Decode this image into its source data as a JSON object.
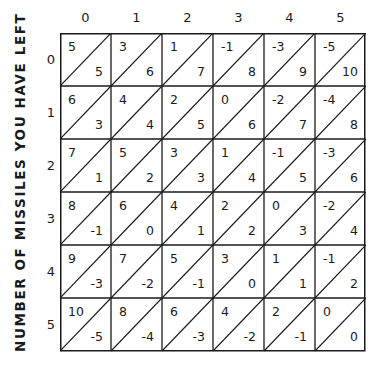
{
  "axis": {
    "vertical_title": "NUMBER OF MISSILES YOU HAVE LEFT",
    "columns": [
      "0",
      "1",
      "2",
      "3",
      "4",
      "5"
    ],
    "rows": [
      "0",
      "1",
      "2",
      "3",
      "4",
      "5"
    ]
  },
  "grid": {
    "rows": [
      [
        {
          "upper": "5",
          "lower": "5"
        },
        {
          "upper": "3",
          "lower": "6"
        },
        {
          "upper": "1",
          "lower": "7"
        },
        {
          "upper": "-1",
          "lower": "8"
        },
        {
          "upper": "-3",
          "lower": "9"
        },
        {
          "upper": "-5",
          "lower": "10"
        }
      ],
      [
        {
          "upper": "6",
          "lower": "3"
        },
        {
          "upper": "4",
          "lower": "4"
        },
        {
          "upper": "2",
          "lower": "5"
        },
        {
          "upper": "0",
          "lower": "6"
        },
        {
          "upper": "-2",
          "lower": "7"
        },
        {
          "upper": "-4",
          "lower": "8"
        }
      ],
      [
        {
          "upper": "7",
          "lower": "1"
        },
        {
          "upper": "5",
          "lower": "2"
        },
        {
          "upper": "3",
          "lower": "3"
        },
        {
          "upper": "1",
          "lower": "4"
        },
        {
          "upper": "-1",
          "lower": "5"
        },
        {
          "upper": "-3",
          "lower": "6"
        }
      ],
      [
        {
          "upper": "8",
          "lower": "-1"
        },
        {
          "upper": "6",
          "lower": "0"
        },
        {
          "upper": "4",
          "lower": "1"
        },
        {
          "upper": "2",
          "lower": "2"
        },
        {
          "upper": "0",
          "lower": "3"
        },
        {
          "upper": "-2",
          "lower": "4"
        }
      ],
      [
        {
          "upper": "9",
          "lower": "-3"
        },
        {
          "upper": "7",
          "lower": "-2"
        },
        {
          "upper": "5",
          "lower": "-1"
        },
        {
          "upper": "3",
          "lower": "0"
        },
        {
          "upper": "1",
          "lower": "1"
        },
        {
          "upper": "-1",
          "lower": "2"
        }
      ],
      [
        {
          "upper": "10",
          "lower": "-5"
        },
        {
          "upper": "8",
          "lower": "-4"
        },
        {
          "upper": "6",
          "lower": "-3"
        },
        {
          "upper": "4",
          "lower": "-2"
        },
        {
          "upper": "2",
          "lower": "-1"
        },
        {
          "upper": "0",
          "lower": "0"
        }
      ]
    ]
  }
}
